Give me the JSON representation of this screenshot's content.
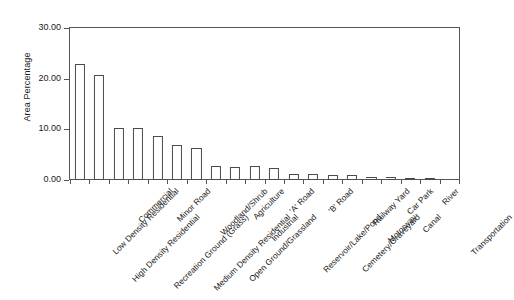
{
  "chart_data": {
    "type": "bar",
    "title": "",
    "subtitle": "",
    "xlabel": "",
    "ylabel": "Area Percentage",
    "ylim": [
      0,
      30
    ],
    "ytick_labels": [
      "0.00",
      "10.00",
      "20.00",
      "30.00"
    ],
    "ytick_values": [
      0,
      10,
      20,
      30
    ],
    "grid": false,
    "legend": null,
    "categories": [
      "Low Density Residential",
      "High Density Residential",
      "Commercial",
      "Recreation Ground (Grass)",
      "Minor Road",
      "Medium Density Residential",
      "Woodland/Shrub",
      "Open Ground/Grassland",
      "Agriculture",
      "Industrial",
      "'A' Road",
      "Reservoir/Lake/Pond",
      "'B' Road",
      "Cemetery/Graveyard",
      "Railway Yard",
      "Motorway",
      "Car Park",
      "Canal",
      "River",
      "Transportation"
    ],
    "values": [
      22.8,
      20.8,
      10.2,
      10.2,
      8.6,
      7.0,
      6.4,
      2.7,
      2.5,
      2.7,
      2.3,
      1.2,
      1.1,
      1.0,
      0.9,
      0.5,
      0.5,
      0.4,
      0.3,
      0.0
    ],
    "bar_fill_color": "#ffffff",
    "bar_edge_color": "#4a4a4a",
    "axis_color": "#555555",
    "background_color": "#ffffff"
  },
  "axis": {
    "y_title": "Area Percentage"
  }
}
